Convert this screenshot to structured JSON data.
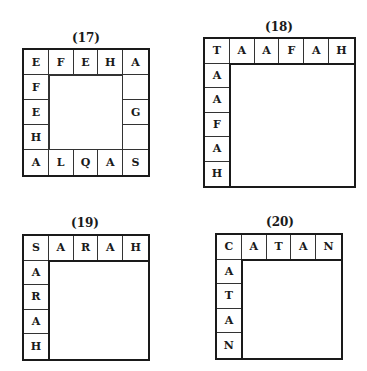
{
  "puzzles": [
    {
      "label": "(17)",
      "type": "ring",
      "size": 5,
      "top_row": [
        "E",
        "F",
        "E",
        "H",
        "A"
      ],
      "bottom_row": [
        "A",
        "L",
        "Q",
        "A",
        "S"
      ],
      "left_col": [
        "E",
        "F",
        "E",
        "H",
        "A"
      ],
      "right_col": [
        "A",
        "",
        "G",
        "",
        "S"
      ]
    },
    {
      "label": "(18)",
      "type": "corner",
      "size": 6,
      "top_row": [
        "T",
        "A",
        "A",
        "F",
        "A",
        "H"
      ],
      "left_col": [
        "T",
        "A",
        "A",
        "F",
        "A",
        "H"
      ]
    },
    {
      "label": "(19)",
      "type": "corner",
      "size": 5,
      "top_row": [
        "S",
        "A",
        "R",
        "A",
        "H"
      ],
      "left_col": [
        "S",
        "A",
        "R",
        "A",
        "H"
      ]
    },
    {
      "label": "(20)",
      "type": "corner",
      "size": 5,
      "top_row": [
        "C",
        "A",
        "T",
        "A",
        "N"
      ],
      "left_col": [
        "C",
        "A",
        "T",
        "A",
        "N"
      ]
    }
  ]
}
